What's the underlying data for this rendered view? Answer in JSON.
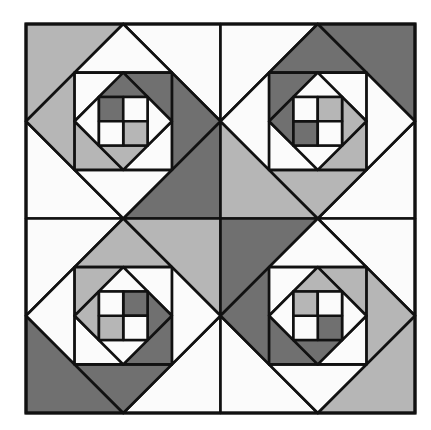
{
  "title": "Quilt block pattern",
  "palette": {
    "W": "#fbfbfb",
    "L": "#b6b6b6",
    "D": "#707070",
    "line": "#111111"
  },
  "quilt": {
    "x": 26,
    "y": 24,
    "size": 389,
    "line_width": 2.6,
    "outer_line_width": 3.2
  },
  "base_block": {
    "outer_corners": {
      "tl": "L",
      "tr": "W",
      "br": "D",
      "bl": "W"
    },
    "outer_triangles": {
      "top": "W",
      "right": "D",
      "bottom": "W",
      "left": "L"
    },
    "inner_square_corners": {
      "tl": "W",
      "tr": "D",
      "br": "W",
      "bl": "L"
    },
    "inner_triangles": {
      "top": "D",
      "right": "W",
      "bottom": "L",
      "left": "W"
    },
    "four_patch": {
      "tl": "D",
      "tr": "W",
      "br": "L",
      "bl": "W"
    }
  },
  "blocks": [
    {
      "name": "top-left",
      "col": 0,
      "row": 0,
      "rotation": 0
    },
    {
      "name": "top-right",
      "col": 1,
      "row": 0,
      "rotation": -90
    },
    {
      "name": "bottom-left",
      "col": 0,
      "row": 1,
      "rotation": 90
    },
    {
      "name": "bottom-right",
      "col": 1,
      "row": 1,
      "rotation": 180
    }
  ]
}
